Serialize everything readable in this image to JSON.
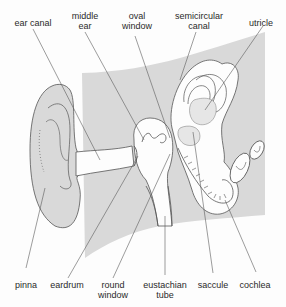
{
  "colors": {
    "background": "#fdfdfd",
    "tissue_fill": "#d9d9d9",
    "outline": "#555555",
    "leader_line": "#5a5a5a",
    "text": "#2a2a2a"
  },
  "labels": {
    "top": [
      {
        "id": "ear-canal",
        "lines": [
          "ear canal"
        ]
      },
      {
        "id": "middle-ear",
        "lines": [
          "middle",
          "ear"
        ]
      },
      {
        "id": "oval-window",
        "lines": [
          "oval",
          "window"
        ]
      },
      {
        "id": "semicircular-canal",
        "lines": [
          "semicircular",
          "canal"
        ]
      },
      {
        "id": "utricle",
        "lines": [
          "utricle"
        ]
      }
    ],
    "bottom": [
      {
        "id": "pinna",
        "lines": [
          "pinna"
        ]
      },
      {
        "id": "eardrum",
        "lines": [
          "eardrum"
        ]
      },
      {
        "id": "round-window",
        "lines": [
          "round",
          "window"
        ]
      },
      {
        "id": "eustachian-tube",
        "lines": [
          "eustachian",
          "tube"
        ]
      },
      {
        "id": "saccule",
        "lines": [
          "saccule"
        ]
      },
      {
        "id": "cochlea",
        "lines": [
          "cochlea"
        ]
      }
    ]
  }
}
